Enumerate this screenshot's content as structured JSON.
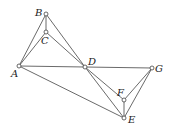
{
  "diagram": {
    "type": "geometry-figure",
    "colors": {
      "line": "#444444",
      "point_fill": "#ffffff",
      "label": "#222222"
    },
    "points": [
      {
        "id": "A",
        "label": "A",
        "x": 19,
        "y": 66,
        "lx": 11,
        "ly": 69
      },
      {
        "id": "B",
        "label": "B",
        "x": 46,
        "y": 14,
        "lx": 35,
        "ly": 8
      },
      {
        "id": "C",
        "label": "C",
        "x": 46,
        "y": 32,
        "lx": 41,
        "ly": 36
      },
      {
        "id": "D",
        "label": "D",
        "x": 85,
        "y": 67,
        "lx": 88,
        "ly": 57
      },
      {
        "id": "G",
        "label": "G",
        "x": 152,
        "y": 68,
        "lx": 155,
        "ly": 64
      },
      {
        "id": "F",
        "label": "F",
        "x": 124,
        "y": 100,
        "lx": 117,
        "ly": 88
      },
      {
        "id": "E",
        "label": "E",
        "x": 124,
        "y": 118,
        "lx": 128,
        "ly": 115
      }
    ],
    "segments": [
      [
        "A",
        "B"
      ],
      [
        "A",
        "C"
      ],
      [
        "B",
        "C"
      ],
      [
        "B",
        "D"
      ],
      [
        "C",
        "D"
      ],
      [
        "A",
        "D"
      ],
      [
        "D",
        "G"
      ],
      [
        "A",
        "E"
      ],
      [
        "D",
        "E"
      ],
      [
        "D",
        "F"
      ],
      [
        "F",
        "E"
      ],
      [
        "F",
        "G"
      ],
      [
        "G",
        "E"
      ]
    ]
  }
}
